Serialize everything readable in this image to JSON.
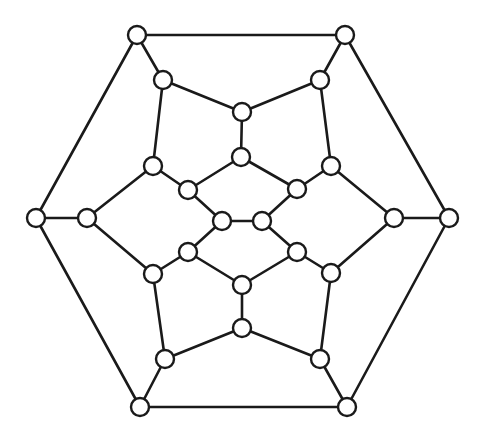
{
  "diagram": {
    "type": "graph",
    "style": {
      "stroke_color": "#1a1a1a",
      "node_fill": "#ffffff",
      "background": "#ffffff",
      "node_radius": 9
    },
    "nodes": [
      {
        "id": "O0",
        "x": 137,
        "y": 35
      },
      {
        "id": "O1",
        "x": 345,
        "y": 35
      },
      {
        "id": "O2",
        "x": 449,
        "y": 218
      },
      {
        "id": "O3",
        "x": 347,
        "y": 407
      },
      {
        "id": "O4",
        "x": 140,
        "y": 407
      },
      {
        "id": "O5",
        "x": 36,
        "y": 218
      },
      {
        "id": "A0",
        "x": 163,
        "y": 80
      },
      {
        "id": "A1",
        "x": 320,
        "y": 80
      },
      {
        "id": "A2",
        "x": 394,
        "y": 218
      },
      {
        "id": "A3",
        "x": 320,
        "y": 359
      },
      {
        "id": "A4",
        "x": 165,
        "y": 359
      },
      {
        "id": "A5",
        "x": 87,
        "y": 218
      },
      {
        "id": "T",
        "x": 242,
        "y": 112
      },
      {
        "id": "T2",
        "x": 241,
        "y": 157
      },
      {
        "id": "B0",
        "x": 153,
        "y": 166
      },
      {
        "id": "B1",
        "x": 331,
        "y": 166
      },
      {
        "id": "B2",
        "x": 331,
        "y": 273
      },
      {
        "id": "B5",
        "x": 153,
        "y": 274
      },
      {
        "id": "C0",
        "x": 188,
        "y": 190
      },
      {
        "id": "C1",
        "x": 297,
        "y": 189
      },
      {
        "id": "C2",
        "x": 297,
        "y": 252
      },
      {
        "id": "C5",
        "x": 188,
        "y": 252
      },
      {
        "id": "L",
        "x": 222,
        "y": 221
      },
      {
        "id": "R",
        "x": 262,
        "y": 221
      },
      {
        "id": "Bm2",
        "x": 242,
        "y": 285
      },
      {
        "id": "Bm",
        "x": 242,
        "y": 328
      }
    ],
    "edges": [
      [
        "O0",
        "O1"
      ],
      [
        "O1",
        "O2"
      ],
      [
        "O2",
        "O3"
      ],
      [
        "O3",
        "O4"
      ],
      [
        "O4",
        "O5"
      ],
      [
        "O5",
        "O0"
      ],
      [
        "O0",
        "A0"
      ],
      [
        "O1",
        "A1"
      ],
      [
        "O2",
        "A2"
      ],
      [
        "O3",
        "A3"
      ],
      [
        "O4",
        "A4"
      ],
      [
        "O5",
        "A5"
      ],
      [
        "A0",
        "T"
      ],
      [
        "A1",
        "T"
      ],
      [
        "A0",
        "B0"
      ],
      [
        "A1",
        "B1"
      ],
      [
        "A5",
        "B0"
      ],
      [
        "A5",
        "B5"
      ],
      [
        "A2",
        "B1"
      ],
      [
        "A2",
        "B2"
      ],
      [
        "A3",
        "B2"
      ],
      [
        "A3",
        "Bm"
      ],
      [
        "A4",
        "Bm"
      ],
      [
        "A4",
        "B5"
      ],
      [
        "T",
        "T2"
      ],
      [
        "T2",
        "C0"
      ],
      [
        "T2",
        "C1"
      ],
      [
        "B0",
        "C0"
      ],
      [
        "B1",
        "C1"
      ],
      [
        "C0",
        "L"
      ],
      [
        "C1",
        "R"
      ],
      [
        "L",
        "R"
      ],
      [
        "L",
        "C5"
      ],
      [
        "R",
        "C2"
      ],
      [
        "C5",
        "B5"
      ],
      [
        "C2",
        "B2"
      ],
      [
        "C5",
        "Bm2"
      ],
      [
        "C2",
        "Bm2"
      ],
      [
        "Bm2",
        "Bm"
      ]
    ]
  }
}
